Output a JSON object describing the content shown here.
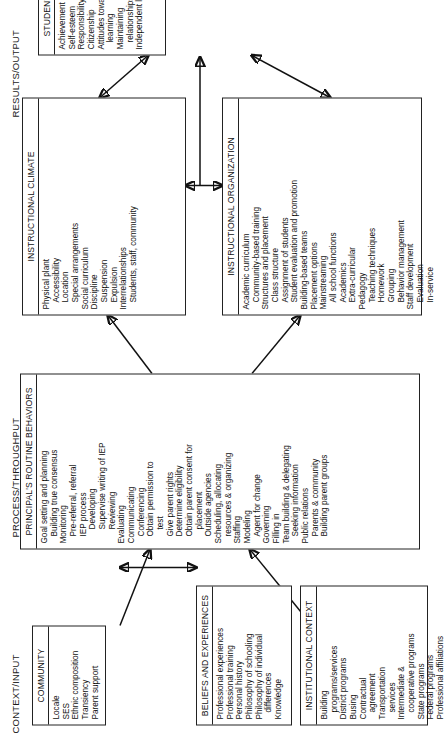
{
  "diagram": {
    "orientation": "rotated-90-ccw",
    "bands": [
      {
        "id": "context",
        "label": "CONTEXT/INPUT"
      },
      {
        "id": "process",
        "label": "PROCESS/THROUGHPUT"
      },
      {
        "id": "results",
        "label": "RESULTS/OUTPUT"
      }
    ]
  },
  "boxes": {
    "community": {
      "title": "COMMUNITY",
      "items": [
        {
          "text": "Locale",
          "level": 0
        },
        {
          "text": "SES",
          "level": 0
        },
        {
          "text": "Ethnic composition",
          "level": 0
        },
        {
          "text": "Transiency",
          "level": 0
        },
        {
          "text": "Parent support",
          "level": 0
        }
      ]
    },
    "beliefs": {
      "title": "BELIEFS AND EXPERIENCES",
      "items": [
        {
          "text": "Professional experiences",
          "level": 0
        },
        {
          "text": "Professional training",
          "level": 0
        },
        {
          "text": "Personal history",
          "level": 0
        },
        {
          "text": "Philosophy of schooling",
          "level": 0
        },
        {
          "text": "Philosophy of individual",
          "level": 0
        },
        {
          "text": "differences",
          "level": 1
        },
        {
          "text": "Knowledge",
          "level": 0
        }
      ]
    },
    "institutional_context": {
      "title": "INSTITUTIONAL CONTEXT",
      "items": [
        {
          "text": "Building",
          "level": 0
        },
        {
          "text": "programs/services",
          "level": 1
        },
        {
          "text": "District programs",
          "level": 0
        },
        {
          "text": "Busing",
          "level": 0
        },
        {
          "text": "Contractual",
          "level": 0
        },
        {
          "text": "agreement",
          "level": 1
        },
        {
          "text": "Transportation",
          "level": 0
        },
        {
          "text": "services",
          "level": 1
        },
        {
          "text": "Intermediate &",
          "level": 0
        },
        {
          "text": "cooperative programs",
          "level": 1
        },
        {
          "text": "State programs",
          "level": 0
        },
        {
          "text": "Federal programs",
          "level": 0
        },
        {
          "text": "Professional affiliations",
          "level": 0
        }
      ]
    },
    "principals_routine_behaviors": {
      "title": "PRINCIPAL'S ROUTINE BEHAVIORS",
      "items": [
        {
          "text": "Goal setting and planning",
          "level": 0
        },
        {
          "text": "Building true consensus",
          "level": 1
        },
        {
          "text": "Monitoring",
          "level": 0
        },
        {
          "text": "Pre-referral, referral",
          "level": 1
        },
        {
          "text": "IEP process",
          "level": 1
        },
        {
          "text": "Developing",
          "level": 2
        },
        {
          "text": "Supervise writing of IEP",
          "level": 2
        },
        {
          "text": "Reviewing",
          "level": 2
        },
        {
          "text": "Evaluating",
          "level": 0
        },
        {
          "text": "Communicating",
          "level": 0
        },
        {
          "text": "Conferencing",
          "level": 1
        },
        {
          "text": "Obtain permission to",
          "level": 1
        },
        {
          "text": "test",
          "level": 2
        },
        {
          "text": "Give parent rights",
          "level": 1
        },
        {
          "text": "Determine eligibility",
          "level": 1
        },
        {
          "text": "Obtain parent consent for",
          "level": 1
        },
        {
          "text": "placement",
          "level": 2
        },
        {
          "text": "Outside agencies",
          "level": 1
        },
        {
          "text": "Scheduling, allocating",
          "level": 0
        },
        {
          "text": "resources & organizing",
          "level": 1
        },
        {
          "text": "Staffing",
          "level": 0
        },
        {
          "text": "Modeling",
          "level": 0
        },
        {
          "text": "Agent for change",
          "level": 1
        },
        {
          "text": "Governing",
          "level": 0
        },
        {
          "text": "Filling in",
          "level": 0
        },
        {
          "text": "Team building & delegating",
          "level": 0
        },
        {
          "text": "Seeking information",
          "level": 1
        },
        {
          "text": "Public relations",
          "level": 0
        },
        {
          "text": "Parents & community",
          "level": 1
        },
        {
          "text": "Building parent groups",
          "level": 1
        }
      ]
    },
    "instructional_climate": {
      "title": "INSTRUCTIONAL CLIMATE",
      "items": [
        {
          "text": "Physical plant",
          "level": 0
        },
        {
          "text": "Accessibility",
          "level": 1
        },
        {
          "text": "Location",
          "level": 1
        },
        {
          "text": "Special arrangements",
          "level": 1
        },
        {
          "text": "Social curriculum",
          "level": 0
        },
        {
          "text": "Discipline",
          "level": 0
        },
        {
          "text": "Suspension",
          "level": 1
        },
        {
          "text": "Expulsion",
          "level": 1
        },
        {
          "text": "Interrelationships",
          "level": 0
        },
        {
          "text": "Students, staff, community",
          "level": 1
        }
      ]
    },
    "instructional_organization": {
      "title": "INSTRUCTIONAL ORGANIZATION",
      "items": [
        {
          "text": "Academic curriculum",
          "level": 0
        },
        {
          "text": "Community-based training",
          "level": 1
        },
        {
          "text": "Structures and placement",
          "level": 0
        },
        {
          "text": "Class structure",
          "level": 1
        },
        {
          "text": "Assignment of students",
          "level": 1
        },
        {
          "text": "Student evaluation and promotion",
          "level": 1
        },
        {
          "text": "Building-based teams",
          "level": 0
        },
        {
          "text": "Placement options",
          "level": 0
        },
        {
          "text": "Mainstreaming",
          "level": 0
        },
        {
          "text": "All school functions",
          "level": 1
        },
        {
          "text": "Academics",
          "level": 1
        },
        {
          "text": "Extra-curricular",
          "level": 1
        },
        {
          "text": "Pedagogy",
          "level": 0
        },
        {
          "text": "Teaching techniques",
          "level": 1
        },
        {
          "text": "Homework",
          "level": 1
        },
        {
          "text": "Grouping",
          "level": 1
        },
        {
          "text": "Behavior management",
          "level": 1
        },
        {
          "text": "Staff development",
          "level": 0
        },
        {
          "text": "Evaluation",
          "level": 1
        },
        {
          "text": "In-service",
          "level": 1
        }
      ]
    },
    "student_outcomes": {
      "title": "STUDENT OUTCOMES",
      "items": [
        {
          "text": "Achievement",
          "level": 0
        },
        {
          "text": "Self-esteem",
          "level": 0
        },
        {
          "text": "Responsibility",
          "level": 0
        },
        {
          "text": "Citizenship",
          "level": 0
        },
        {
          "text": "Attitudes toward",
          "level": 0
        },
        {
          "text": "learning",
          "level": 1
        },
        {
          "text": "Maintaining",
          "level": 0
        },
        {
          "text": "relationships",
          "level": 1
        },
        {
          "text": "Independent living",
          "level": 0
        }
      ]
    }
  }
}
